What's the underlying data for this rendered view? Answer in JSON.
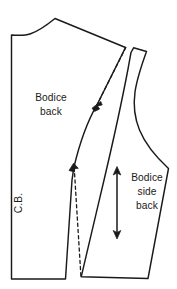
{
  "figure": {
    "type": "sewing-pattern-diagram",
    "background_color": "#ffffff",
    "line_color": "#1a1a1a",
    "width_px": 177,
    "height_px": 289
  },
  "labels": {
    "bodice_back_line1": "Bodice",
    "bodice_back_line2": "back",
    "center_back": "C.B.",
    "bodice_side_back_line1": "Bodice",
    "bodice_side_back_line2": "side",
    "bodice_side_back_line3": "back"
  },
  "pieces": [
    {
      "name": "bodice-back",
      "label": "Bodice back",
      "center_back_label": "C.B.",
      "notches": 2,
      "has_dashed_seam": true
    },
    {
      "name": "bodice-side-back",
      "label": "Bodice side back",
      "notches": 0,
      "has_grainline": true
    }
  ],
  "markings": {
    "grainline": "double-headed-arrow",
    "notch_upper": "notch-mark",
    "notch_lower": "notch-mark",
    "dashed_style": "original-seam-line"
  }
}
